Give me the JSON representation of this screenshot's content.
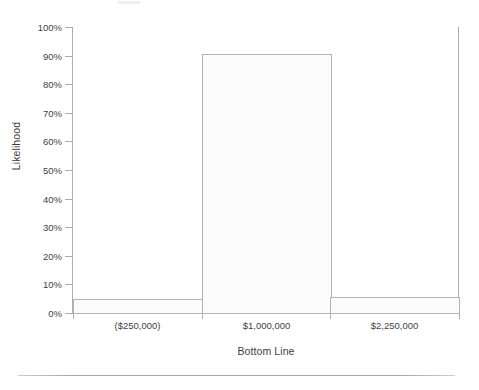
{
  "chart_data": {
    "type": "bar",
    "title": "",
    "subtitle": "",
    "xlabel": "Bottom Line",
    "ylabel": "Likelihood",
    "categories": [
      "($250,000)",
      "$1,000,000",
      "$2,250,000"
    ],
    "values": [
      4.9,
      90.5,
      5.6
    ],
    "value_labels": [
      "5%",
      "90%",
      "6%"
    ],
    "ylim": [
      0,
      100
    ],
    "ytick_labels": [
      "0%",
      "10%",
      "20%",
      "30%",
      "40%",
      "50%",
      "60%",
      "70%",
      "80%",
      "90%",
      "100%"
    ],
    "ytick_values": [
      0,
      10,
      20,
      30,
      40,
      50,
      60,
      70,
      80,
      90,
      100
    ],
    "yunit": "%",
    "grid": false,
    "legend": "none",
    "series": [
      {
        "name": "Likelihood",
        "values": [
          4.9,
          90.5,
          5.6
        ]
      }
    ],
    "bar_fill_color": "#fbfbfb",
    "bar_border_color": "#b2b2b2",
    "axis_color": "#aeaeae",
    "text_color": "#3f3f3f"
  },
  "figure": {
    "background_color": "#ffffff",
    "has_bottom_rule": true
  }
}
